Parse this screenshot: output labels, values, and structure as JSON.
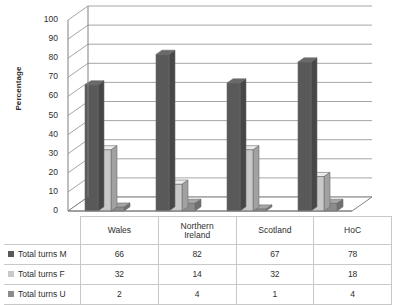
{
  "chart_data": {
    "type": "bar",
    "title": "",
    "subtitle": "",
    "xlabel": "",
    "ylabel": "Percentage",
    "ylim": [
      0,
      100
    ],
    "ytick_step": 10,
    "yticks": [
      100,
      90,
      80,
      70,
      60,
      50,
      40,
      30,
      20,
      10,
      0
    ],
    "grid": true,
    "legend_position": "data-table",
    "style": "3d-clustered-column-with-data-table",
    "categories": [
      "Wales",
      "Northern Ireland",
      "Scotland",
      "HoC"
    ],
    "category_lines": [
      [
        "Wales"
      ],
      [
        "Northern",
        "Ireland"
      ],
      [
        "Scotland"
      ],
      [
        "HoC"
      ]
    ],
    "series": [
      {
        "name": "Total turns M",
        "values": [
          66,
          82,
          67,
          78
        ],
        "color": "#595959"
      },
      {
        "name": "Total turns F",
        "values": [
          32,
          14,
          32,
          18
        ],
        "color": "#c9c9c9"
      },
      {
        "name": "Total turns U",
        "values": [
          2,
          4,
          1,
          4
        ],
        "color": "#8c8c8c"
      }
    ]
  },
  "colors": {
    "series_m": "#595959",
    "series_f": "#c9c9c9",
    "series_u": "#8c8c8c",
    "grid": "#a6a6a6",
    "axis": "#808080",
    "floor": "#ffffff",
    "table_border": "#c8c8c8",
    "text": "#2e2e2e",
    "background": "#ffffff"
  },
  "table": {
    "column_headers": [
      "",
      "Wales",
      "Northern Ireland",
      "Scotland",
      "HoC"
    ],
    "rows": [
      {
        "label": "Total turns M",
        "cells": [
          "66",
          "82",
          "67",
          "78"
        ]
      },
      {
        "label": "Total turns F",
        "cells": [
          "32",
          "14",
          "32",
          "18"
        ]
      },
      {
        "label": "Total turns U",
        "cells": [
          "2",
          "4",
          "1",
          "4"
        ]
      }
    ]
  }
}
